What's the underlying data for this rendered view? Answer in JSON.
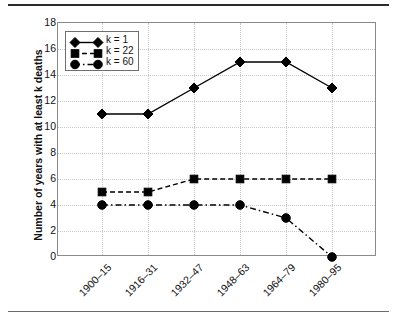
{
  "chart_data": {
    "type": "line",
    "title": "",
    "xlabel": "",
    "ylabel": "Number of years with at least k deaths",
    "ylim": [
      0,
      18
    ],
    "ytick_step": 2,
    "yticks": [
      0,
      2,
      4,
      6,
      8,
      10,
      12,
      14,
      16,
      18
    ],
    "grid": true,
    "legend_position": "top-left inside plot",
    "categories": [
      "1900–15",
      "1916–31",
      "1932–47",
      "1948–63",
      "1964–79",
      "1980–95"
    ],
    "series": [
      {
        "name": "k = 1",
        "values": [
          11,
          11,
          13,
          15,
          15,
          13
        ],
        "marker": "diamond",
        "line_style": "solid",
        "color": "#000000"
      },
      {
        "name": "k = 22",
        "values": [
          5,
          5,
          6,
          6,
          6,
          6
        ],
        "marker": "square",
        "line_style": "dashed",
        "color": "#000000"
      },
      {
        "name": "k = 60",
        "values": [
          4,
          4,
          4,
          4,
          3,
          0
        ],
        "marker": "circle",
        "line_style": "dash-dot",
        "color": "#000000"
      }
    ]
  },
  "axes": {
    "y_title": "Number of years with at least k deaths",
    "y_tick_labels": [
      "18",
      "16",
      "14",
      "12",
      "10",
      "8",
      "6",
      "4",
      "2",
      "0"
    ],
    "x_tick_labels": [
      "1900–15",
      "1916–31",
      "1932–47",
      "1948–63",
      "1964–79",
      "1980–95"
    ]
  },
  "legend": {
    "entries": [
      {
        "label": "k = 1",
        "marker": "diamond",
        "line_style": "solid"
      },
      {
        "label": "k = 22",
        "marker": "square",
        "line_style": "dashed"
      },
      {
        "label": "k = 60",
        "marker": "circle",
        "line_style": "dash-dot"
      }
    ]
  },
  "style": {
    "series_color": "#000000",
    "grid_color": "#c9c9c9",
    "axis_color": "#8a8a8a",
    "rule_color": "#2b2b2b",
    "background": "#ffffff"
  }
}
